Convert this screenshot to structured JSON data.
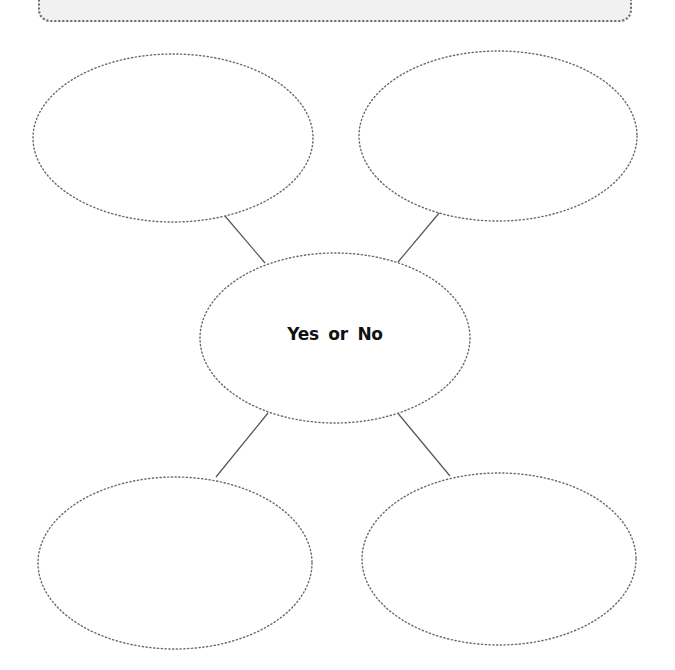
{
  "diagram": {
    "type": "spider-map",
    "center": {
      "label": "Yes  or  No"
    },
    "header_box": {
      "text": ""
    },
    "nodes": [
      {
        "id": "top-left",
        "text": ""
      },
      {
        "id": "top-right",
        "text": ""
      },
      {
        "id": "bottom-left",
        "text": ""
      },
      {
        "id": "bottom-right",
        "text": ""
      }
    ],
    "colors": {
      "background": "#ffffff",
      "header_fill": "#f1f1f1",
      "dotted_stroke": "#6a6a6a",
      "connector_stroke": "#555555",
      "label_text": "#111111"
    }
  }
}
